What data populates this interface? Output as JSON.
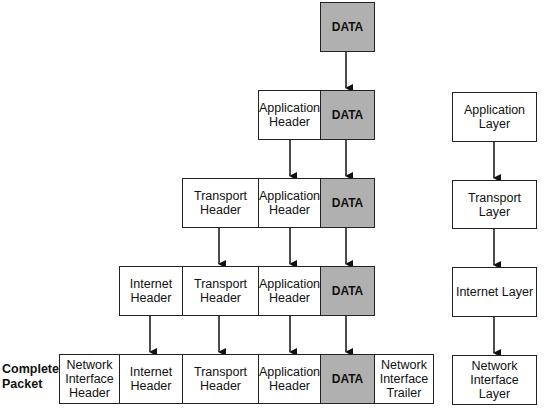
{
  "diagram": {
    "encapsulation_rows": [
      {
        "row": 1,
        "segments": [
          "DATA"
        ]
      },
      {
        "row": 2,
        "segments": [
          "Application\nHeader",
          "DATA"
        ]
      },
      {
        "row": 3,
        "segments": [
          "Transport\nHeader",
          "Application\nHeader",
          "DATA"
        ]
      },
      {
        "row": 4,
        "segments": [
          "Internet\nHeader",
          "Transport\nHeader",
          "Application\nHeader",
          "DATA"
        ]
      },
      {
        "row": 5,
        "segments": [
          "Network\nInterface\nHeader",
          "Internet\nHeader",
          "Transport\nHeader",
          "Application\nHeader",
          "DATA",
          "Network\nInterface\nTrailer"
        ]
      }
    ],
    "complete_packet_label": "Complete\nPacket",
    "layers": [
      "Application\nLayer",
      "Transport Layer",
      "Internet Layer",
      "Network\nInterface Layer"
    ],
    "data_fill": "#b0b0b0"
  }
}
